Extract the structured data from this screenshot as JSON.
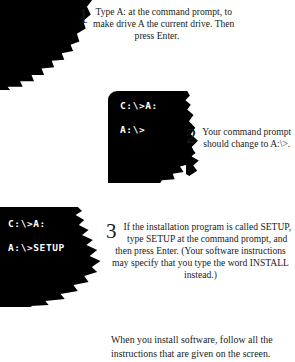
{
  "page": {
    "background_color": "#ffffff",
    "ink_color": "#000000",
    "text_color": "#1a1a1a",
    "terminal_text_color": "#ffffff"
  },
  "steps": [
    {
      "number": "1",
      "text": "Type A: at the command prompt, to make drive A the current drive. Then press Enter."
    },
    {
      "number": "2",
      "text": "Your command prompt should change to A:\\>."
    },
    {
      "number": "3",
      "text": "If the installation program is called SETUP, type SETUP at the command prompt, and then press Enter. (Your software instructions may specify that you type the word INSTALL instead.)"
    }
  ],
  "terminals": [
    {
      "name": "terminal-after-drive-change",
      "lines": [
        "C:\\>A:",
        "A:\\>"
      ]
    },
    {
      "name": "terminal-setup-command",
      "lines": [
        "C:\\>A:",
        "A:\\>SETUP"
      ]
    }
  ],
  "closing_note": "When you install software, follow all the instructions that are given on the screen."
}
